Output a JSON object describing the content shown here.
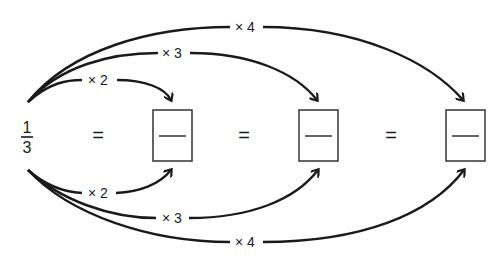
{
  "diagram": {
    "start_fraction": {
      "numerator": "1",
      "denominator": "3"
    },
    "equals": [
      "=",
      "=",
      "="
    ],
    "boxes": [
      {
        "numerator": "",
        "denominator": ""
      },
      {
        "numerator": "",
        "denominator": ""
      },
      {
        "numerator": "",
        "denominator": ""
      }
    ],
    "top_arrows": [
      {
        "label": "× 2",
        "target_box": 1
      },
      {
        "label": "× 3",
        "target_box": 2
      },
      {
        "label": "× 4",
        "target_box": 3
      }
    ],
    "bottom_arrows": [
      {
        "label": "× 2",
        "target_box": 1
      },
      {
        "label": "× 3",
        "target_box": 2
      },
      {
        "label": "× 4",
        "target_box": 3
      }
    ]
  }
}
